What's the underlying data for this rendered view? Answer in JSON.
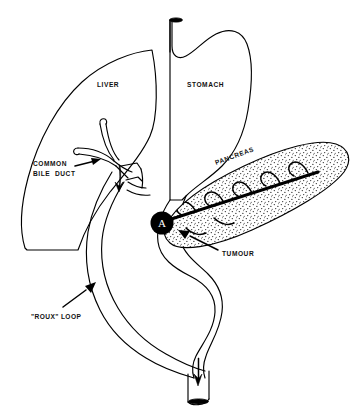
{
  "diagram": {
    "domain": "medical-anatomical-line-drawing",
    "background_color": "#ffffff",
    "line_color": "#000000",
    "canvas": {
      "width": 364,
      "height": 413
    }
  },
  "labels": {
    "liver": "LIVER",
    "stomach": "STOMACH",
    "pancreas": "PANCREAS",
    "common_bile_duct_line1": "COMMON",
    "common_bile_duct_line2": "BILE  DUCT",
    "tumour": "TUMOUR",
    "roux_loop": "\"ROUX\" LOOP",
    "tumour_marker": "A"
  },
  "structures": [
    {
      "name": "liver",
      "label": "LIVER",
      "shape": "outlined wedge / leaf",
      "fill": "#ffffff",
      "stroke": "#000000"
    },
    {
      "name": "stomach",
      "label": "STOMACH",
      "shape": "outlined J-shaped organ with oesophagus",
      "fill": "#ffffff",
      "stroke": "#000000"
    },
    {
      "name": "pancreas",
      "label": "PANCREAS",
      "shape": "stippled elongated body angled up-right",
      "fill": "stipple-dots",
      "stroke": "#000000"
    },
    {
      "name": "common-bile-duct",
      "label": "COMMON BILE  DUCT",
      "shape": "Y-shaped duct with two open stumps"
    },
    {
      "name": "roux-loop",
      "label": "\"ROUX\" LOOP",
      "shape": "long S-curved double-walled jejunal limb"
    },
    {
      "name": "tumour",
      "label": "TUMOUR",
      "marker": "A",
      "shape": "solid black disc at pancreatic head",
      "fill": "#000000"
    }
  ],
  "markers": {
    "oesophagus_cut_end": "solid black ellipse cap",
    "jejunum_cut_end": "solid black ellipse cap",
    "bile_flow_arrow": "downward arrowhead",
    "bowel_flow_arrow": "downward arrowhead"
  },
  "annotations": [
    {
      "label": "COMMON BILE  DUCT",
      "leader": "arrow pointing up-right to duct junction"
    },
    {
      "label": "TUMOUR",
      "leader": "arrow pointing up-left to black disc A"
    },
    {
      "label": "\"ROUX\" LOOP",
      "leader": "arrow pointing up-right to jejunal limb"
    }
  ]
}
